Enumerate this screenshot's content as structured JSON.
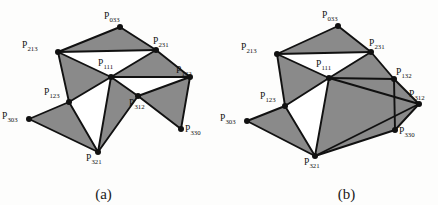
{
  "figure": {
    "panels": [
      {
        "id": "a",
        "caption": "(a)",
        "style": {
          "fill": "#8a8a8a",
          "stroke": "#111111",
          "vertex_color": "#111111",
          "background": "#fdfdfc"
        },
        "vertices": [
          {
            "name": "P033",
            "label": "P",
            "sub": "033",
            "x": 120,
            "y": 27,
            "lx": 104,
            "ly": 12
          },
          {
            "name": "P213",
            "label": "P",
            "sub": "213",
            "x": 58,
            "y": 52,
            "lx": 22,
            "ly": 41
          },
          {
            "name": "P231",
            "label": "P",
            "sub": "231",
            "x": 156,
            "y": 50,
            "lx": 153,
            "ly": 37
          },
          {
            "name": "P111",
            "label": "P",
            "sub": "111",
            "x": 111,
            "y": 77,
            "lx": 98,
            "ly": 59
          },
          {
            "name": "P132",
            "label": "P",
            "sub": "132",
            "x": 190,
            "y": 77,
            "lx": 176,
            "ly": 66
          },
          {
            "name": "P123",
            "label": "P",
            "sub": "123",
            "x": 69,
            "y": 102,
            "lx": 44,
            "ly": 88
          },
          {
            "name": "P312",
            "label": "P",
            "sub": "312",
            "x": 138,
            "y": 96,
            "lx": 129,
            "ly": 99
          },
          {
            "name": "P303",
            "label": "P",
            "sub": "303",
            "x": 29,
            "y": 119,
            "lx": 2,
            "ly": 112
          },
          {
            "name": "P330",
            "label": "P",
            "sub": "330",
            "x": 181,
            "y": 129,
            "lx": 185,
            "ly": 125
          },
          {
            "name": "P321",
            "label": "P",
            "sub": "321",
            "x": 98,
            "y": 152,
            "lx": 86,
            "ly": 154
          }
        ],
        "shaded_triangles": [
          [
            "P033",
            "P213",
            "P231"
          ],
          [
            "P213",
            "P111",
            "P123"
          ],
          [
            "P111",
            "P231",
            "P132"
          ],
          [
            "P111",
            "P312",
            "P321"
          ],
          [
            "P132",
            "P312",
            "P330"
          ],
          [
            "P303",
            "P123",
            "P321"
          ]
        ],
        "white_triangles": [
          [
            "P213",
            "P111",
            "P231"
          ],
          [
            "P111",
            "P132",
            "P312"
          ],
          [
            "P123",
            "P111",
            "P321"
          ]
        ],
        "edges": [
          [
            "P033",
            "P213"
          ],
          [
            "P033",
            "P231"
          ],
          [
            "P213",
            "P231"
          ],
          [
            "P213",
            "P111"
          ],
          [
            "P111",
            "P231"
          ],
          [
            "P231",
            "P132"
          ],
          [
            "P111",
            "P132"
          ],
          [
            "P111",
            "P123"
          ],
          [
            "P213",
            "P123"
          ],
          [
            "P123",
            "P303"
          ],
          [
            "P303",
            "P321"
          ],
          [
            "P123",
            "P321"
          ],
          [
            "P111",
            "P321"
          ],
          [
            "P111",
            "P312"
          ],
          [
            "P312",
            "P321"
          ],
          [
            "P132",
            "P312"
          ],
          [
            "P132",
            "P330"
          ],
          [
            "P312",
            "P330"
          ]
        ]
      },
      {
        "id": "b",
        "caption": "(b)",
        "style": {
          "fill": "#8a8a8a",
          "stroke": "#111111",
          "vertex_color": "#111111",
          "background": "#fdfdfc"
        },
        "vertices": [
          {
            "name": "P033",
            "label": "P",
            "sub": "033",
            "x": 119,
            "y": 26,
            "lx": 103,
            "ly": 11
          },
          {
            "name": "P213",
            "label": "P",
            "sub": "213",
            "x": 58,
            "y": 54,
            "lx": 22,
            "ly": 43
          },
          {
            "name": "P231",
            "label": "P",
            "sub": "231",
            "x": 152,
            "y": 52,
            "lx": 150,
            "ly": 39
          },
          {
            "name": "P111",
            "label": "P",
            "sub": "111",
            "x": 110,
            "y": 78,
            "lx": 97,
            "ly": 60
          },
          {
            "name": "P132",
            "label": "P",
            "sub": "132",
            "x": 175,
            "y": 79,
            "lx": 177,
            "ly": 68
          },
          {
            "name": "P123",
            "label": "P",
            "sub": "123",
            "x": 66,
            "y": 106,
            "lx": 41,
            "ly": 92
          },
          {
            "name": "P312",
            "label": "P",
            "sub": "312",
            "x": 200,
            "y": 104,
            "lx": 190,
            "ly": 90
          },
          {
            "name": "P303",
            "label": "P",
            "sub": "303",
            "x": 28,
            "y": 121,
            "lx": 1,
            "ly": 114
          },
          {
            "name": "P330",
            "label": "P",
            "sub": "330",
            "x": 176,
            "y": 130,
            "lx": 180,
            "ly": 127
          },
          {
            "name": "P321",
            "label": "P",
            "sub": "321",
            "x": 96,
            "y": 156,
            "lx": 85,
            "ly": 158
          }
        ],
        "shaded_triangles": [
          [
            "P033",
            "P213",
            "P231"
          ],
          [
            "P213",
            "P111",
            "P123"
          ],
          [
            "P111",
            "P231",
            "P132"
          ],
          [
            "P111",
            "P312",
            "P321"
          ],
          [
            "P111",
            "P132",
            "P312"
          ],
          [
            "P303",
            "P123",
            "P321"
          ],
          [
            "P312",
            "P330",
            "P321"
          ]
        ],
        "white_triangles": [
          [
            "P213",
            "P111",
            "P231"
          ],
          [
            "P132",
            "P312",
            "P330"
          ],
          [
            "P123",
            "P111",
            "P321"
          ]
        ],
        "edges": [
          [
            "P033",
            "P213"
          ],
          [
            "P033",
            "P231"
          ],
          [
            "P213",
            "P231"
          ],
          [
            "P213",
            "P111"
          ],
          [
            "P111",
            "P231"
          ],
          [
            "P231",
            "P132"
          ],
          [
            "P111",
            "P132"
          ],
          [
            "P111",
            "P123"
          ],
          [
            "P213",
            "P123"
          ],
          [
            "P123",
            "P303"
          ],
          [
            "P303",
            "P321"
          ],
          [
            "P123",
            "P321"
          ],
          [
            "P111",
            "P321"
          ],
          [
            "P111",
            "P312"
          ],
          [
            "P312",
            "P321"
          ],
          [
            "P132",
            "P312"
          ],
          [
            "P132",
            "P330"
          ],
          [
            "P312",
            "P330"
          ],
          [
            "P330",
            "P321"
          ]
        ]
      }
    ]
  }
}
